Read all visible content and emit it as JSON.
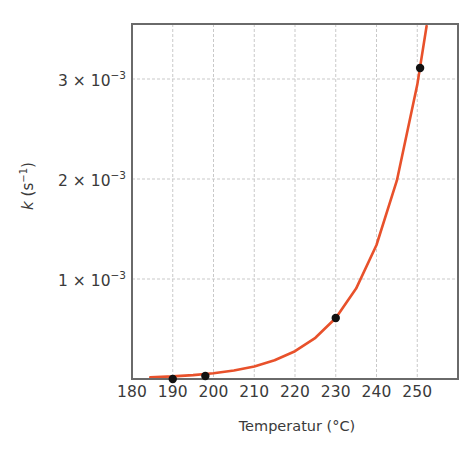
{
  "chart_data": {
    "type": "scatter",
    "title": "",
    "xlabel": "Temperatur (°C)",
    "ylabel": "k (s⁻¹)",
    "ylabel_parts": {
      "var": "k",
      "open": " (",
      "base": "s",
      "exp": "−1",
      "close": ")"
    },
    "xlim": [
      180,
      260
    ],
    "ylim": [
      0,
      0.00355
    ],
    "grid": true,
    "legend": null,
    "x_ticks": [
      180,
      190,
      200,
      210,
      220,
      230,
      240,
      250
    ],
    "x_tick_labels": [
      "180",
      "190",
      "200",
      "210",
      "220",
      "230",
      "240",
      "250"
    ],
    "y_ticks": [
      0.001,
      0.002,
      0.003
    ],
    "y_tick_labels": [
      {
        "mantissa": "1 × 10",
        "exp": "−3"
      },
      {
        "mantissa": "2 × 10",
        "exp": "−3"
      },
      {
        "mantissa": "3 × 10",
        "exp": "−3"
      }
    ],
    "series": [
      {
        "name": "Messpunkte",
        "kind": "scatter",
        "color": "#111111",
        "x": [
          190,
          198,
          230,
          250.7
        ],
        "y": [
          0.0,
          3e-05,
          0.00061,
          0.00311
        ]
      },
      {
        "name": "Exponentielle Anpassung",
        "kind": "line",
        "color": "#e8512b",
        "x": [
          184.5,
          190,
          195,
          200,
          205,
          210,
          215,
          220,
          225,
          230,
          235,
          240,
          245,
          250,
          252.3
        ],
        "y": [
          1.7e-05,
          2.6e-05,
          3.9e-05,
          5.8e-05,
          8.5e-05,
          0.000126,
          0.000187,
          0.000278,
          0.000412,
          0.00061,
          0.000904,
          0.00134,
          0.001986,
          0.002944,
          0.00353
        ]
      }
    ],
    "colors": {
      "axis": "#6a6a6a",
      "grid": "#c9c9c9",
      "curve": "#e8512b",
      "points": "#111111",
      "text": "#3a3a3a"
    }
  }
}
